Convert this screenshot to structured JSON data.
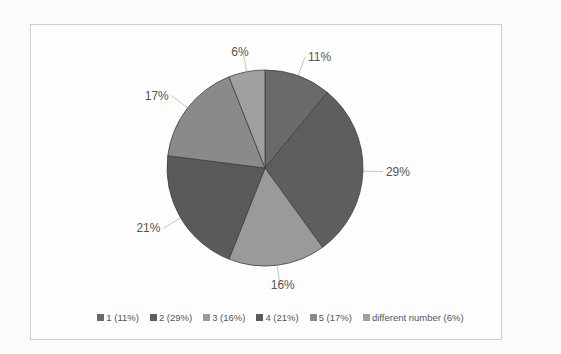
{
  "chart_data": {
    "type": "pie",
    "title": "",
    "categories": [
      "1",
      "2",
      "3",
      "4",
      "5",
      "different number"
    ],
    "values": [
      11,
      29,
      16,
      21,
      17,
      6
    ],
    "data_labels": [
      "11%",
      "29%",
      "16%",
      "21%",
      "17%",
      "6%"
    ],
    "colors": [
      "#6a6a6a",
      "#5e5e5e",
      "#9a9a9a",
      "#5a5a5a",
      "#8a8a8a",
      "#a0a0a0"
    ],
    "start_angle": "12 o'clock",
    "direction": "clockwise",
    "legend_position": "bottom",
    "legend": [
      {
        "label": "1 (11%)",
        "color": "#6a6a6a"
      },
      {
        "label": "2 (29%)",
        "color": "#5e5e5e"
      },
      {
        "label": "3 (16%)",
        "color": "#9a9a9a"
      },
      {
        "label": "4 (21%)",
        "color": "#5a5a5a"
      },
      {
        "label": "5 (17%)",
        "color": "#8a8a8a"
      },
      {
        "label": "different number (6%)",
        "color": "#a0a0a0"
      }
    ]
  }
}
